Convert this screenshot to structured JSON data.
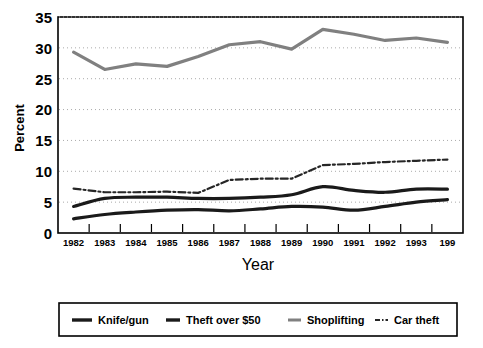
{
  "chart_data": {
    "type": "line",
    "title": "",
    "xlabel": "Year",
    "ylabel": "Percent",
    "ylim": [
      0,
      35
    ],
    "yticks": [
      0,
      5,
      10,
      15,
      20,
      25,
      30,
      35
    ],
    "grid": true,
    "legend_position": "bottom",
    "categories": [
      "1982",
      "1983",
      "1984",
      "1985",
      "1986",
      "1987",
      "1988",
      "1989",
      "1990",
      "1991",
      "1992",
      "1993",
      "199"
    ],
    "x_tick_labels": [
      "1982",
      "1983",
      "1984",
      "1985",
      "1986",
      "1987",
      "1988",
      "1989",
      "1990",
      "1991",
      "1992",
      "1993",
      "199"
    ],
    "y_tick_labels": [
      "0",
      "5",
      "10",
      "15",
      "20",
      "25",
      "30",
      "35"
    ],
    "series": [
      {
        "name": "Knife/gun",
        "color": "#1a1a1a",
        "style": "solid",
        "width": 3.2,
        "values": [
          2.3,
          3.0,
          3.4,
          3.7,
          3.8,
          3.6,
          3.9,
          4.3,
          4.2,
          3.7,
          4.3,
          5.0,
          5.4
        ]
      },
      {
        "name": "Theft over $50",
        "color": "#1a1a1a",
        "style": "solid",
        "width": 3.2,
        "values": [
          4.3,
          5.6,
          5.8,
          5.8,
          5.6,
          5.6,
          5.8,
          6.2,
          7.5,
          6.9,
          6.6,
          7.1,
          7.1
        ]
      },
      {
        "name": "Shoplifting",
        "color": "#808080",
        "style": "solid",
        "width": 3.2,
        "values": [
          29.3,
          26.5,
          27.4,
          27.0,
          28.6,
          30.5,
          31.0,
          29.8,
          33.0,
          32.2,
          31.2,
          31.6,
          30.9
        ]
      },
      {
        "name": "Car theft",
        "color": "#262626",
        "style": "dashdot",
        "width": 2.2,
        "values": [
          7.2,
          6.6,
          6.6,
          6.7,
          6.5,
          8.6,
          8.8,
          8.8,
          11.0,
          11.2,
          11.5,
          11.7,
          11.9
        ]
      }
    ]
  },
  "legend": {
    "items": [
      {
        "label": "Knife/gun",
        "swatch": "line-swatch-black-thick"
      },
      {
        "label": "Theft over $50",
        "swatch": "line-swatch-black-thick"
      },
      {
        "label": "Shoplifting",
        "swatch": "line-swatch-gray"
      },
      {
        "label": "Car theft",
        "swatch": "line-swatch-dashdot"
      }
    ]
  },
  "colors": {
    "axis": "#000000",
    "grid": "#aaaaaa",
    "dark_series": "#1a1a1a",
    "gray_series": "#808080",
    "background": "#ffffff"
  }
}
